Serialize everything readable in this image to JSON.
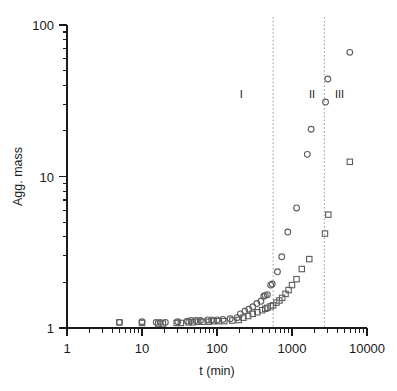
{
  "chart_data": {
    "type": "scatter",
    "title": "",
    "xlabel": "t (min)",
    "ylabel": "Agg. mass",
    "xscale": "log",
    "yscale": "log",
    "xlim": [
      1,
      10000
    ],
    "ylim": [
      1,
      100
    ],
    "xticks": [
      1,
      10,
      100,
      1000,
      10000
    ],
    "xtick_labels": [
      "1",
      "10",
      "100",
      "1000",
      "10000"
    ],
    "yticks": [
      1,
      10,
      100
    ],
    "ytick_labels": [
      "1",
      "10",
      "100"
    ],
    "grid": false,
    "legend": null,
    "annotations": [
      {
        "text": "I",
        "x": 210,
        "y": 33
      },
      {
        "text": "II",
        "x": 1850,
        "y": 33
      },
      {
        "text": "III",
        "x": 4300,
        "y": 33
      }
    ],
    "vertical_dividers": [
      {
        "x": 560,
        "style": "dotted",
        "color": "#9b9b9b"
      },
      {
        "x": 2700,
        "style": "dotted",
        "color": "#9b9b9b"
      }
    ],
    "series": [
      {
        "name": "circles",
        "marker": "circle",
        "color": "#5d5d5d",
        "points": [
          [
            5.0,
            1.09
          ],
          [
            10.0,
            1.1
          ],
          [
            15.5,
            1.09
          ],
          [
            17.5,
            1.09
          ],
          [
            20.5,
            1.09
          ],
          [
            30.0,
            1.1
          ],
          [
            40.0,
            1.11
          ],
          [
            45.0,
            1.12
          ],
          [
            52.0,
            1.12
          ],
          [
            60.0,
            1.12
          ],
          [
            75.0,
            1.13
          ],
          [
            85.0,
            1.13
          ],
          [
            100.0,
            1.13
          ],
          [
            120.0,
            1.14
          ],
          [
            150.0,
            1.15
          ],
          [
            185.0,
            1.17
          ],
          [
            205.0,
            1.24
          ],
          [
            235.0,
            1.29
          ],
          [
            265.0,
            1.33
          ],
          [
            300.0,
            1.38
          ],
          [
            340.0,
            1.45
          ],
          [
            385.0,
            1.5
          ],
          [
            420.0,
            1.62
          ],
          [
            440.0,
            1.64
          ],
          [
            470.0,
            1.66
          ],
          [
            520.0,
            1.92
          ],
          [
            545.0,
            1.95
          ],
          [
            640.0,
            2.35
          ],
          [
            730.0,
            2.95
          ],
          [
            880.0,
            4.3
          ],
          [
            1150.0,
            6.2
          ],
          [
            1600.0,
            14.0
          ],
          [
            1800.0,
            20.5
          ],
          [
            2800.0,
            31.0
          ],
          [
            3000.0,
            44.0
          ],
          [
            5900.0,
            66.0
          ]
        ]
      },
      {
        "name": "squares",
        "marker": "square",
        "color": "#5d5d5d",
        "points": [
          [
            5.0,
            1.09
          ],
          [
            10.0,
            1.08
          ],
          [
            16.5,
            1.07
          ],
          [
            19.0,
            1.07
          ],
          [
            29.0,
            1.08
          ],
          [
            33.0,
            1.08
          ],
          [
            42.0,
            1.09
          ],
          [
            47.0,
            1.09
          ],
          [
            56.0,
            1.1
          ],
          [
            64.0,
            1.1
          ],
          [
            78.0,
            1.1
          ],
          [
            90.0,
            1.11
          ],
          [
            105.0,
            1.11
          ],
          [
            125.0,
            1.11
          ],
          [
            160.0,
            1.12
          ],
          [
            195.0,
            1.13
          ],
          [
            225.0,
            1.17
          ],
          [
            260.0,
            1.2
          ],
          [
            300.0,
            1.24
          ],
          [
            345.0,
            1.27
          ],
          [
            400.0,
            1.31
          ],
          [
            440.0,
            1.34
          ],
          [
            470.0,
            1.36
          ],
          [
            520.0,
            1.39
          ],
          [
            560.0,
            1.41
          ],
          [
            620.0,
            1.47
          ],
          [
            680.0,
            1.52
          ],
          [
            740.0,
            1.58
          ],
          [
            820.0,
            1.68
          ],
          [
            900.0,
            1.78
          ],
          [
            1000.0,
            1.92
          ],
          [
            1150.0,
            2.1
          ],
          [
            1350.0,
            2.45
          ],
          [
            1700.0,
            2.85
          ],
          [
            2750.0,
            4.2
          ],
          [
            3050.0,
            5.6
          ],
          [
            5900.0,
            12.5
          ]
        ]
      }
    ]
  },
  "axis": {
    "x_label": "t (min)",
    "y_label": "Agg. mass",
    "x_tick_labels": [
      "1",
      "10",
      "100",
      "1000",
      "10000"
    ],
    "y_tick_labels": [
      "100",
      "10",
      "1"
    ]
  },
  "regions": {
    "one": "I",
    "two": "II",
    "three": "III"
  },
  "colors": {
    "axis": "#1a1a1a",
    "marker": "#5d5d5d",
    "divider": "#9b9b9b",
    "background": "#ffffff"
  }
}
